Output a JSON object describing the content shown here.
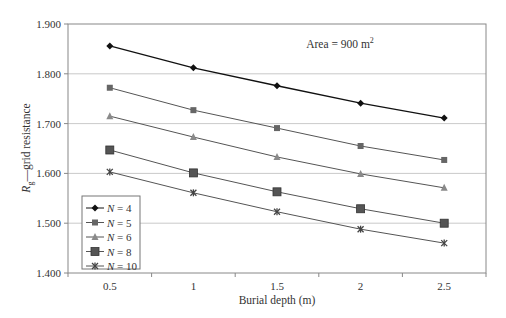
{
  "chart_data": {
    "type": "line",
    "title": "",
    "annotation": "Area = 900 m²",
    "annotation_base": "Area = 900 m",
    "annotation_sup": "2",
    "xlabel": "Burial depth (m)",
    "ylabel_main": "R",
    "ylabel_sub": "g",
    "ylabel_rest": "—grid resistance",
    "x": [
      0.5,
      1,
      1.5,
      2,
      2.5
    ],
    "x_tick_labels": [
      "0.5",
      "1",
      "1.5",
      "2",
      "2.5"
    ],
    "y_tick_labels": [
      "1.400",
      "1.500",
      "1.600",
      "1.700",
      "1.800",
      "1.900"
    ],
    "ylim": [
      1.4,
      1.9
    ],
    "xlim": [
      0.25,
      2.75
    ],
    "grid": "horizontal",
    "legend_position": "lower-left",
    "series": [
      {
        "name": "N = 4",
        "var": "N",
        "eq": " = 4",
        "marker": "diamond",
        "color": "#111111",
        "values": [
          1.856,
          1.812,
          1.776,
          1.741,
          1.711
        ]
      },
      {
        "name": "N = 5",
        "var": "N",
        "eq": " = 5",
        "marker": "square",
        "color": "#666666",
        "values": [
          1.772,
          1.727,
          1.691,
          1.655,
          1.627
        ]
      },
      {
        "name": "N = 6",
        "var": "N",
        "eq": " = 6",
        "marker": "triangle",
        "color": "#8a8a8a",
        "values": [
          1.715,
          1.673,
          1.633,
          1.599,
          1.571
        ]
      },
      {
        "name": "N = 8",
        "var": "N",
        "eq": " = 8",
        "marker": "big-square",
        "color": "#555555",
        "values": [
          1.647,
          1.601,
          1.563,
          1.529,
          1.5
        ]
      },
      {
        "name": "N = 10",
        "var": "N",
        "eq": " = 10",
        "marker": "star",
        "color": "#444444",
        "values": [
          1.603,
          1.561,
          1.523,
          1.488,
          1.46
        ]
      }
    ]
  }
}
